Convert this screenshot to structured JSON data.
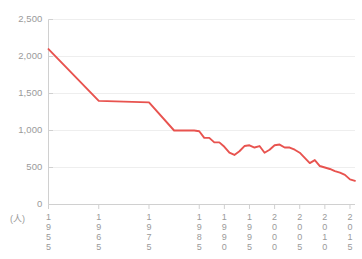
{
  "chart_data": {
    "type": "line",
    "title": "",
    "subtitle": "",
    "xlabel": "",
    "ylabel": "",
    "unit_label": "(人)",
    "grid": true,
    "legend": null,
    "line_color": "#e8534f",
    "axis_color": "#d0d0d0",
    "grid_color": "#eeeeee",
    "tick_text_color": "#9a9a9a",
    "xlim": [
      1955,
      2016
    ],
    "ylim": [
      0,
      2500
    ],
    "y_ticks": [
      0,
      500,
      1000,
      1500,
      2000,
      2500
    ],
    "y_tick_labels": [
      "0",
      "500",
      "1,000",
      "1,500",
      "2,000",
      "2,500"
    ],
    "x_ticks": [
      1955,
      1965,
      1975,
      1985,
      1990,
      1995,
      2000,
      2005,
      2010,
      2015
    ],
    "x_tick_labels": [
      "1955",
      "1965",
      "1975",
      "1985",
      "1990",
      "1995",
      "2000",
      "2005",
      "2010",
      "2015"
    ],
    "series": [
      {
        "name": "value",
        "x": [
          1955,
          1965,
          1975,
          1980,
          1982,
          1984,
          1985,
          1986,
          1987,
          1988,
          1989,
          1990,
          1991,
          1992,
          1993,
          1994,
          1995,
          1996,
          1997,
          1998,
          1999,
          2000,
          2001,
          2002,
          2003,
          2004,
          2005,
          2006,
          2007,
          2008,
          2009,
          2010,
          2011,
          2012,
          2013,
          2014,
          2015,
          2016
        ],
        "values": [
          2100,
          1400,
          1380,
          1000,
          1000,
          1000,
          990,
          900,
          900,
          840,
          840,
          780,
          700,
          670,
          720,
          790,
          800,
          770,
          790,
          700,
          740,
          800,
          810,
          770,
          770,
          740,
          700,
          630,
          560,
          600,
          520,
          500,
          480,
          450,
          430,
          400,
          340,
          320
        ]
      }
    ]
  }
}
